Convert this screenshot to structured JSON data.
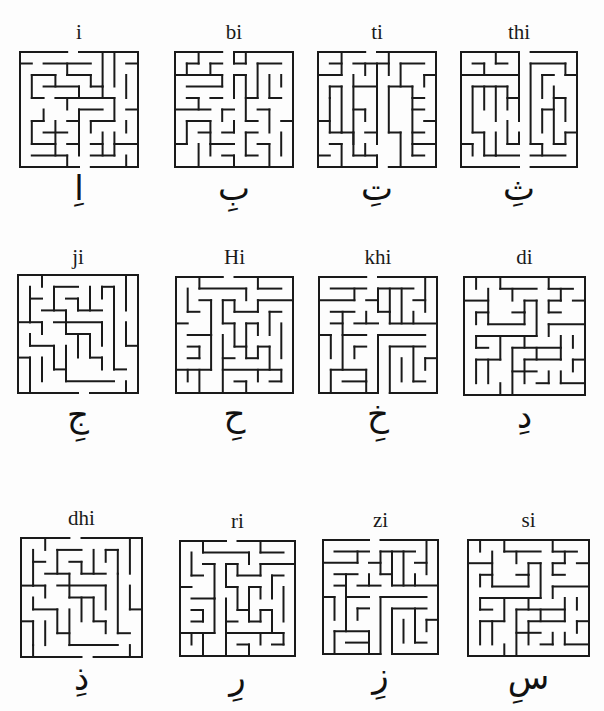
{
  "page": {
    "background": "#fdfdfd",
    "ink": "#1a1a1a"
  },
  "mazes": [
    {
      "label": "i",
      "letter": "اِ",
      "x": 20,
      "y": 52,
      "w": 118,
      "h": 115,
      "label_y": 4,
      "letter_y": 170,
      "walls": "0,0,4,0|5,0,10,0|0,0,0,10|10,0,10,10|0,10,5,10|6,10,10,10|0,1,1,1|2,1,6,1|4,1,4,2|4,2,6,2|7,0,7,3|8,0,8,3|6,2,6,3|9,1,10,1|1,2,3,2|1,2,1,4|3,2,3,3|2,3,5,3|5,3,5,4|6,3,7,3|7,3,7,4|9,2,9,4|1,4,2,4|3,4,8,4|4,4,4,5|8,4,8,6|9,5,10,5|2,5,2,6|1,6,2,6|5,5,7,5|5,5,5,8|0,6,0,6|1,6,1,8|3,6,3,9|2,7,4,7|1,8,3,8|4,6,5,6|6,6,8,6|6,6,6,7|9,6,9,7|8,7,8,9|7,7,7,9|6,8,7,8|4,8,5,8|5,8,5,9|1,9,4,9|4,9,4,10|8,8,10,8|9,9,9,10|6,9,8,9"
    },
    {
      "label": "bi",
      "letter": "بِ",
      "x": 175,
      "y": 52,
      "w": 118,
      "h": 115,
      "label_y": 4,
      "letter_y": 170,
      "walls": "0,0,4,0|5,0,10,0|0,0,0,10|10,0,10,10|0,10,6,10|6,10,10,10|1,1,1,2|1,1,2,1|2,0,2,1|3,1,4,1|3,1,3,2|5,0,5,1|5,1,6,1|6,0,6,1|7,1,9,1|0,2,4,2|4,2,4,3|5,2,6,2|5,2,5,4|7,1,7,4|8,2,8,4|8,4,9,4|9,2,9,3|1,3,4,3|1,4,2,4|2,4,2,5|3,4,4,4|6,2,6,6|6,4,7,4|4,5,5,5|4,5,4,6|0,5,3,5|1,6,3,6|1,6,1,8|3,6,3,8|7,5,8,5|8,5,8,7|9,6,10,6|6,6,7,6|2,7,3,7|4,7,5,7|5,6,5,7|6,7,7,7|6,7,6,9|7,8,8,8|8,8,8,10|9,7,9,9|0,8,1,8|2,8,2,10|3,8,5,8|3,8,3,9|4,9,5,9|5,9,5,10|6,9,7,9"
    },
    {
      "label": "ti",
      "letter": "تِ",
      "x": 318,
      "y": 52,
      "w": 118,
      "h": 115,
      "label_y": 4,
      "letter_y": 170,
      "walls": "0,0,4,0|5,0,10,0|0,0,0,10|10,0,10,10|0,10,5,10|6,10,10,10|1,1,2,1|2,0,2,2|0,2,2,2|3,1,6,1|4,1,4,2|6,0,6,2|7,1,9,1|7,1,7,3|3,2,3,8|9,2,10,2|9,2,9,3|5,1,5,7|1,3,1,4|1,3,2,3|2,3,2,7|3,3,5,3|6,3,8,3|6,3,6,7|8,3,8,9|8,4,9,4|8,5,9,5|1,4,1,7|3,5,4,5|4,5,4,6|0,6,1,6|1,7,2,7|6,7,7,7|7,7,7,10|9,6,10,6|8,7,9,7|8,8,10,8|2,7,3,7|3,7,3,9|4,7,5,7|5,7,5,8|4,8,4,9|1,8,2,8|2,8,2,10|0,9,1,9|3,9,5,9|5,9,5,10|8,9,9,9"
    },
    {
      "label": "thi",
      "letter": "ثِ",
      "x": 461,
      "y": 52,
      "w": 116,
      "h": 115,
      "label_y": 4,
      "letter_y": 170,
      "walls": "0,0,5,0|6,0,10,0|0,0,0,10|10,0,10,10|0,10,5,10|6,10,10,10|1,1,2,1|2,1,2,2|3,0,3,1|3,1,4,1|0,2,5,2|5,0,5,4|6,1,6,8|6,1,9,1|9,1,9,2|9,2,10,2|7,2,8,2|7,2,7,4|1,3,4,3|1,3,1,7|2,3,2,5|3,3,3,6|4,3,4,5|4,4,5,4|5,4,5,6|8,3,8,8|8,4,9,4|9,4,9,6|7,5,8,5|7,5,7,7|1,7,2,7|2,7,2,9|3,7,3,9|4,6,4,8|4,8,5,8|5,7,5,8|0,8,1,8|1,8,1,9|6,8,7,8|7,8,7,9|6,9,9,9|9,7,10,7|9,7,9,8|8,8,9,8|3,9,5,9|2,9,3,9"
    },
    {
      "label": "ji",
      "letter": "جِ",
      "x": 18,
      "y": 275,
      "w": 120,
      "h": 118,
      "label_y": -28,
      "letter_y": 126,
      "walls": "0,0,5,0|5,0,10,0|0,0,0,10|10,0,10,10|0,10,5,10|6,10,10,10|2,0,2,1|1,1,1,4|1,2,2,2|3,1,5,1|3,1,3,3|4,2,5,2|5,2,5,3|5,3,7,3|6,1,6,3|7,1,7,2|7,1,8,1|8,1,8,3|9,0,9,3|2,3,4,3|4,3,4,5|0,4,1,4|1,4,2,4|2,4,2,5|3,4,7,4|7,4,7,6|8,3,8,8|9,4,9,6|9,6,10,6|1,5,1,6|1,6,3,6|3,6,3,8|3,8,4,8|4,5,6,5|5,5,5,7|4,6,4,9|6,5,6,7|6,7,7,7|7,7,7,8|2,7,2,9|8,8,9,8|4,9,8,9|1,9,1,10|9,9,9,10|0,7,1,7|1,7,1,9"
    },
    {
      "label": "Hi",
      "letter": "حِ",
      "x": 176,
      "y": 277,
      "w": 117,
      "h": 116,
      "label_y": -30,
      "letter_y": 124,
      "walls": "0,0,4,0|5,0,10,0|0,0,0,10|10,0,10,10|0,10,10,10|2,0,2,1|2,1,6,1|6,1,6,2|7,0,7,1|7,1,9,1|1,1,1,3|1,3,2,3|2,2,3,2|3,2,3,5|4,2,5,2|4,2,4,4|5,2,5,3|5,3,7,3|7,2,7,3|7,2,10,2|8,3,9,3|8,3,8,5|6,4,7,4|6,4,6,6|7,4,7,5|9,4,9,7|4,4,5,4|5,4,5,6|5,6,6,6|6,6,6,7|6,7,7,7|7,6,7,7|7,6,8,6|8,6,8,8|0,4,1,4|1,5,3,5|3,5,3,8|1,6,2,6|2,6,2,7|1,7,2,7|4,5,4,10|4,7,5,7|0,8,3,8|1,8,1,9|2,8,2,10|4,8,9,8|5,9,6,9|6,9,6,10|7,8,7,9|8,9,9,9|9,8,9,9"
    },
    {
      "label": "khi",
      "letter": "خِ",
      "x": 319,
      "y": 277,
      "w": 118,
      "h": 116,
      "label_y": -30,
      "letter_y": 122,
      "walls": "0,0,4,0|5,0,10,0|0,0,0,10|10,0,10,10|0,10,5,10|6,10,10,10|1,1,4,1|3,1,3,2|5,1,8,1|5,1,5,3|6,1,6,3|7,1,7,4|9,0,9,3|8,2,9,2|0,2,3,2|4,2,5,2|1,3,3,3|2,3,2,8|4,3,4,4|3,4,5,4|5,3,6,3|6,3,6,4|6,4,10,4|8,3,8,4|1,4,2,4|2,5,4,5|5,5,9,5|5,5,5,10|0,5,1,5|1,5,1,7|3,6,4,6|3,6,3,7|6,6,9,6|6,6,6,10|7,7,7,9|8,6,8,9|9,7,10,7|9,7,9,8|1,8,4,8|1,8,1,10|4,8,4,9|2,9,4,9|8,9,9,9|4,9,4,10"
    },
    {
      "label": "di",
      "letter": "دِ",
      "x": 464,
      "y": 277,
      "w": 121,
      "h": 118,
      "label_y": -30,
      "letter_y": 120,
      "walls": "0,0,5,0|5,0,10,0|0,0,0,10|10,0,10,10|0,10,6,10|6,10,10,10|1,0,1,1|3,0,3,1|3,1,6,1|4,1,4,2|7,0,7,1|7,1,9,1|8,1,8,2|2,1,2,3|0,2,2,2|5,2,6,2|5,2,5,3|6,2,6,5|7,2,7,3|7,2,8,2|9,2,10,2|1,3,2,3|1,3,1,4|2,3,2,4|2,4,5,4|4,3,5,3|5,3,5,4|7,3,8,3|7,4,10,4|7,4,7,5|1,5,4,5|1,5,1,6|1,6,2,6|3,5,3,7|4,5,6,5|5,5,5,6|4,6,8,6|4,6,4,10|8,5,8,7|9,5,9,6|6,6,6,7|1,7,3,7|1,7,1,9|2,7,2,9|5,7,8,7|5,7,5,9|4,8,6,8|9,7,10,7|9,7,9,8|7,8,7,9|6,9,7,9|3,9,3,10|8,8,8,9|8,9,10,9"
    },
    {
      "label": "dhi",
      "letter": "ذِ",
      "x": 21,
      "y": 538,
      "w": 121,
      "h": 119,
      "label_y": -30,
      "letter_y": 122,
      "walls": "0,0,4,0|5,0,10,0|0,0,0,10|10,0,10,10|0,10,5,10|6,10,10,10|2,0,2,1|1,1,1,4|1,2,2,2|3,1,5,1|3,1,3,3|4,2,5,2|5,2,5,3|5,3,7,3|6,1,6,3|7,1,7,2|7,1,8,1|8,1,8,3|9,0,9,3|2,3,4,3|4,3,4,5|0,4,1,4|1,4,2,4|2,4,2,5|3,4,7,4|7,4,7,6|8,3,8,8|9,4,9,6|9,6,10,6|1,5,1,6|1,6,3,6|3,6,3,8|3,8,4,8|4,5,6,5|5,5,5,7|4,6,4,9|6,5,6,7|6,7,7,7|7,7,7,8|2,7,2,9|8,8,9,8|4,9,8,9|1,9,1,10|9,9,9,10|0,7,1,7|1,7,1,9"
    },
    {
      "label": "ri",
      "letter": "رِ",
      "x": 180,
      "y": 541,
      "w": 115,
      "h": 115,
      "label_y": -30,
      "letter_y": 120,
      "walls": "0,0,4,0|5,0,10,0|0,0,0,10|10,0,10,10|0,10,5,10|5,10,10,10|2,0,2,1|2,1,6,1|6,1,6,2|7,0,7,1|7,1,9,1|1,1,1,3|1,3,2,3|2,2,3,2|3,2,3,5|4,2,5,2|4,2,4,4|5,2,5,3|5,3,7,3|7,2,7,3|7,2,10,2|8,3,9,3|8,3,8,5|6,4,7,4|6,4,6,6|7,4,7,5|9,4,9,7|4,4,5,4|5,4,5,6|5,6,6,6|6,6,6,7|6,7,7,7|7,6,7,7|7,6,8,6|8,6,8,8|0,4,1,4|1,5,3,5|3,5,3,8|1,6,2,6|2,6,2,7|1,7,2,7|4,5,4,10|4,7,5,7|0,8,3,8|1,8,1,9|2,8,2,10|4,8,9,8|5,9,6,9|6,9,6,10|7,8,7,9|8,9,9,9|9,8,9,9"
    },
    {
      "label": "zi",
      "letter": "زِ",
      "x": 323,
      "y": 540,
      "w": 115,
      "h": 114,
      "label_y": -30,
      "letter_y": 120,
      "walls": "0,0,4,0|5,0,10,0|0,0,0,10|10,0,10,10|0,10,5,10|6,10,10,10|1,1,4,1|3,1,3,2|5,1,8,1|5,1,5,3|6,1,6,3|7,1,7,4|9,0,9,3|8,2,9,2|0,2,3,2|4,2,5,2|1,3,3,3|2,3,2,8|4,3,4,4|3,4,5,4|5,3,6,3|6,3,6,4|6,4,10,4|8,3,8,4|1,4,2,4|2,5,4,5|5,5,9,5|5,5,5,10|0,5,1,5|1,5,1,7|3,6,4,6|3,6,3,7|6,6,9,6|6,6,6,10|7,7,7,9|8,6,8,9|9,7,10,7|9,7,9,8|1,8,4,8|1,8,1,10|4,8,4,9|2,9,4,9|8,9,9,9|4,9,4,10"
    },
    {
      "label": "si",
      "letter": "سِ",
      "x": 468,
      "y": 540,
      "w": 121,
      "h": 116,
      "label_y": -30,
      "letter_y": 120,
      "walls": "0,0,5,0|5,0,10,0|0,0,0,10|10,0,10,10|0,10,6,10|6,10,10,10|1,0,1,1|3,0,3,1|3,1,6,1|4,1,4,2|7,0,7,1|7,1,9,1|8,1,8,2|2,1,2,3|0,2,2,2|5,2,6,2|5,2,5,3|6,2,6,5|7,2,7,3|7,2,8,2|9,2,10,2|1,3,2,3|1,3,1,4|2,3,2,4|2,4,5,4|4,3,5,3|5,3,5,4|7,3,8,3|7,4,10,4|7,4,7,5|1,5,4,5|1,5,1,6|1,6,2,6|3,5,3,7|4,5,6,5|5,5,5,6|4,6,8,6|4,6,4,10|8,5,8,7|9,5,9,6|6,6,6,7|1,7,3,7|1,7,1,9|2,7,2,9|5,7,8,7|5,7,5,9|4,8,6,8|9,7,10,7|9,7,9,8|7,8,7,9|6,9,7,9|3,9,3,10|8,8,8,9|8,9,10,9"
    }
  ]
}
